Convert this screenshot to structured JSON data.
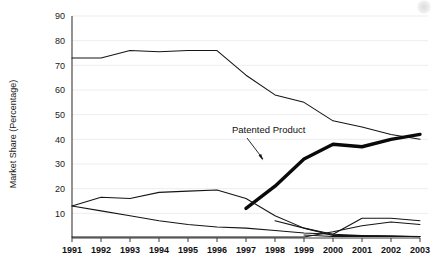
{
  "chart_data": {
    "type": "line",
    "title": "",
    "xlabel": "",
    "ylabel": "Market Share (Percentage)",
    "categories": [
      "1991",
      "1992",
      "1993",
      "1994",
      "1995",
      "1996",
      "1997",
      "1998",
      "1999",
      "2000",
      "2001",
      "2002",
      "2003"
    ],
    "x": [
      1991,
      1992,
      1993,
      1994,
      1995,
      1996,
      1997,
      1998,
      1999,
      2000,
      2001,
      2002,
      2003
    ],
    "xlim": [
      1991,
      2003
    ],
    "ylim": [
      0,
      90
    ],
    "yticks": [
      10,
      20,
      30,
      40,
      50,
      60,
      70,
      80,
      90
    ],
    "grid": true,
    "legend": "none",
    "annotations": [
      {
        "text": "Patented Product",
        "points_to_series": "Patented Product",
        "points_to_x": 1999,
        "points_to_y": 32
      }
    ],
    "series": [
      {
        "name": "Originator Brand",
        "style": "thin",
        "x": [
          1991,
          1992,
          1993,
          1994,
          1995,
          1996,
          1997,
          1998,
          1999,
          2000,
          2001,
          2002,
          2003
        ],
        "values": [
          73,
          73,
          76,
          75.5,
          76,
          76,
          66,
          58,
          55,
          47.5,
          45,
          42,
          40
        ]
      },
      {
        "name": "Patented Product",
        "style": "thick",
        "x": [
          1997,
          1998,
          1999,
          2000,
          2001,
          2002,
          2003
        ],
        "values": [
          12,
          21,
          32,
          38,
          37,
          40,
          42
        ]
      },
      {
        "name": "Generic A",
        "style": "thin",
        "x": [
          1991,
          1992,
          1993,
          1994,
          1995,
          1996,
          1997,
          1998,
          1999,
          2000,
          2001,
          2002,
          2003
        ],
        "values": [
          13,
          16.5,
          16,
          18.5,
          19,
          19.5,
          16,
          9,
          4,
          1,
          1,
          0.8,
          0.5
        ]
      },
      {
        "name": "Generic B",
        "style": "thin",
        "x": [
          1991,
          1992,
          1993,
          1994,
          1995,
          1996,
          1997,
          1998,
          1999,
          2000,
          2001,
          2002,
          2003
        ],
        "values": [
          13,
          11,
          9,
          7,
          5.5,
          4.5,
          4,
          3,
          2,
          1.5,
          1,
          0.8,
          0.6
        ]
      },
      {
        "name": "Generic C",
        "style": "thin",
        "x": [
          1998,
          1999,
          2000,
          2001,
          2002,
          2003
        ],
        "values": [
          7,
          4,
          1.5,
          8,
          8,
          7
        ]
      },
      {
        "name": "Generic D",
        "style": "thin",
        "x": [
          1991,
          1992,
          1993,
          1994,
          1995,
          1996,
          1997,
          1998,
          1999,
          2000,
          2001,
          2002,
          2003
        ],
        "values": [
          0.4,
          0.4,
          0.4,
          0.4,
          0.4,
          0.4,
          0.4,
          0.4,
          0.4,
          2.5,
          5,
          6.5,
          5.5
        ]
      },
      {
        "name": "Generic E",
        "style": "thin",
        "x": [
          1999,
          2000,
          2001,
          2002,
          2003
        ],
        "values": [
          1.2,
          0.6,
          0.6,
          0.6,
          0.6
        ]
      }
    ]
  },
  "axis": {
    "y_label": "Market Share (Percentage)",
    "y_tick_labels": [
      "90",
      "80",
      "70",
      "60",
      "50",
      "40",
      "30",
      "20",
      "10"
    ],
    "x_tick_labels": [
      "1991",
      "1992",
      "1993",
      "1994",
      "1995",
      "1996",
      "1997",
      "1998",
      "1999",
      "2000",
      "2001",
      "2002",
      "2003"
    ]
  },
  "annotation": {
    "patented_product_label": "Patented Product"
  },
  "colors": {
    "line": "#141414",
    "thick_line": "#0a0a0a",
    "grid": "#ededf2",
    "axis": "#3a3a3a",
    "background": "#ffffff"
  }
}
